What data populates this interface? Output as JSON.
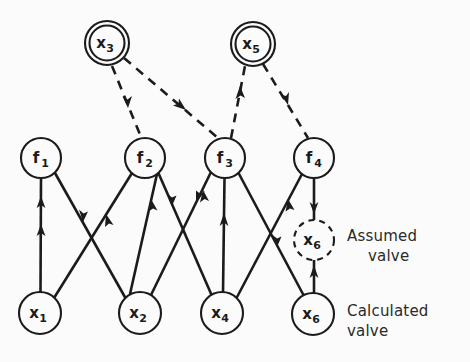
{
  "figure": {
    "background_color": "#fbfbfb",
    "ink_color": "#1b1b1b"
  },
  "legend": {
    "assumed": {
      "line1": "Assumed",
      "line2": "valve"
    },
    "calculated": {
      "line1": "Calculated",
      "line2": "valve"
    }
  },
  "nodes": [
    {
      "id": "x3",
      "base": "x",
      "sub": "3",
      "cx": 107,
      "cy": 43,
      "r": 22,
      "style": "double-circle",
      "row": "top",
      "semantic": "assumed-variable"
    },
    {
      "id": "x5",
      "base": "x",
      "sub": "5",
      "cx": 253,
      "cy": 44,
      "r": 22,
      "style": "double-circle",
      "row": "top",
      "semantic": "assumed-variable"
    },
    {
      "id": "f1",
      "base": "f",
      "sub": "1",
      "cx": 41,
      "cy": 158,
      "r": 20,
      "style": "circle",
      "row": "middle",
      "semantic": "equation"
    },
    {
      "id": "f2",
      "base": "f",
      "sub": "2",
      "cx": 145,
      "cy": 158,
      "r": 20,
      "style": "circle",
      "row": "middle",
      "semantic": "equation"
    },
    {
      "id": "f3",
      "base": "f",
      "sub": "3",
      "cx": 225,
      "cy": 158,
      "r": 20,
      "style": "circle",
      "row": "middle",
      "semantic": "equation"
    },
    {
      "id": "f4",
      "base": "f",
      "sub": "4",
      "cx": 314,
      "cy": 158,
      "r": 20,
      "style": "circle",
      "row": "middle",
      "semantic": "equation"
    },
    {
      "id": "x6assum",
      "base": "x",
      "sub": "6",
      "cx": 314,
      "cy": 240,
      "r": 20,
      "style": "dashed-circle",
      "row": "legend",
      "semantic": "assumed-value"
    },
    {
      "id": "x1",
      "base": "x",
      "sub": "1",
      "cx": 40,
      "cy": 313,
      "r": 21,
      "style": "circle",
      "row": "bottom",
      "semantic": "calculated-variable"
    },
    {
      "id": "x2",
      "base": "x",
      "sub": "2",
      "cx": 140,
      "cy": 313,
      "r": 21,
      "style": "circle",
      "row": "bottom",
      "semantic": "calculated-variable"
    },
    {
      "id": "x4",
      "base": "x",
      "sub": "4",
      "cx": 222,
      "cy": 313,
      "r": 21,
      "style": "circle",
      "row": "bottom",
      "semantic": "calculated-variable"
    },
    {
      "id": "x6",
      "base": "x",
      "sub": "6",
      "cx": 313,
      "cy": 314,
      "r": 21,
      "style": "circle",
      "row": "bottom",
      "semantic": "calculated-variable"
    }
  ],
  "edges": [
    {
      "id": "x1-f1",
      "from": "x1",
      "to": "f1",
      "style": "solid",
      "direction": "up",
      "arrow_count": 2
    },
    {
      "id": "f1-x2",
      "from": "f1",
      "to": "x2",
      "style": "solid",
      "direction": "down",
      "arrow_count": 1
    },
    {
      "id": "x2-f2",
      "from": "x2",
      "to": "f2",
      "style": "solid",
      "direction": "up",
      "arrow_count": 1
    },
    {
      "id": "f2-x4",
      "from": "f2",
      "to": "x4",
      "style": "solid",
      "direction": "down",
      "arrow_count": 1
    },
    {
      "id": "x1-f2",
      "from": "x1",
      "to": "f2",
      "style": "solid",
      "direction": "up",
      "arrow_count": 1
    },
    {
      "id": "x4-f3",
      "from": "x4",
      "to": "f3",
      "style": "solid",
      "direction": "up",
      "arrow_count": 1
    },
    {
      "id": "f3-x2",
      "from": "f3",
      "to": "x2",
      "style": "solid",
      "direction": "down",
      "arrow_count": 1
    },
    {
      "id": "x2-f3",
      "from": "x2",
      "to": "f3",
      "style": "solid",
      "direction": "up",
      "arrow_count": 1
    },
    {
      "id": "f3-x6",
      "from": "f3",
      "to": "x6",
      "style": "solid",
      "direction": "down",
      "arrow_count": 1
    },
    {
      "id": "x4-f4",
      "from": "x4",
      "to": "f4",
      "style": "solid",
      "direction": "up",
      "arrow_count": 1
    },
    {
      "id": "f4-x6assum",
      "from": "f4",
      "to": "x6assum",
      "style": "solid",
      "direction": "down",
      "arrow_count": 1
    },
    {
      "id": "x6-x6assum",
      "from": "x6",
      "to": "x6assum",
      "style": "solid",
      "direction": "up",
      "arrow_count": 1
    },
    {
      "id": "x3-f2",
      "from": "x3",
      "to": "f2",
      "style": "dashed",
      "direction": "down",
      "arrow_count": 1
    },
    {
      "id": "x3-f3",
      "from": "x3",
      "to": "f3",
      "style": "dashed",
      "direction": "down",
      "arrow_count": 1
    },
    {
      "id": "f3-x5",
      "from": "f3",
      "to": "x5",
      "style": "dashed",
      "direction": "up",
      "arrow_count": 1
    },
    {
      "id": "x5-f4",
      "from": "x5",
      "to": "f4",
      "style": "dashed",
      "direction": "down",
      "arrow_count": 1
    }
  ]
}
